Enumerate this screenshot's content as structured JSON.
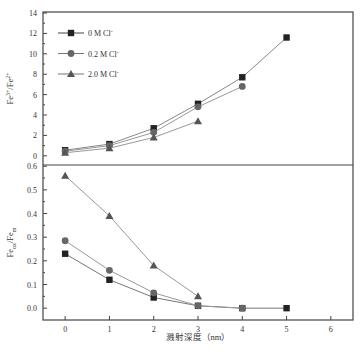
{
  "chart_data": [
    {
      "type": "line",
      "panel": "top",
      "title": "",
      "xlabel": "",
      "ylabel": "Fe3+/Fe2+",
      "ylabel_parts": {
        "base1": "Fe",
        "sup1": "3+",
        "sep": "/Fe",
        "sup2": "2+"
      },
      "xlim": [
        -0.5,
        6.5
      ],
      "ylim": [
        -0.9,
        14.1
      ],
      "yticks": [
        0,
        2,
        4,
        6,
        8,
        10,
        12,
        14
      ],
      "ytick_labels": [
        "0",
        "2",
        "4",
        "6",
        "8",
        "10",
        "12",
        "14"
      ],
      "grid": false,
      "legend": "top-left",
      "series": [
        {
          "name": "0 M Cl-",
          "label": "0 M Cl",
          "sup": "-",
          "marker": "square",
          "color": "#222222",
          "line_color": "#888888",
          "x": [
            0,
            1,
            2,
            3,
            4,
            5
          ],
          "values": [
            0.55,
            1.15,
            2.7,
            5.1,
            7.7,
            11.6
          ]
        },
        {
          "name": "0.2 M Cl-",
          "label": "0.2 M Cl",
          "sup": "-",
          "marker": "circle",
          "color": "#666666",
          "line_color": "#999999",
          "x": [
            0,
            1,
            2,
            3,
            4
          ],
          "values": [
            0.45,
            1.0,
            2.3,
            4.8,
            6.8
          ]
        },
        {
          "name": "2.0 M Cl-",
          "label": "2.0 M Cl",
          "sup": "-",
          "marker": "triangle",
          "color": "#555555",
          "line_color": "#999999",
          "x": [
            0,
            1,
            2,
            3
          ],
          "values": [
            0.3,
            0.75,
            1.8,
            3.4
          ]
        }
      ]
    },
    {
      "type": "line",
      "panel": "bottom",
      "title": "",
      "xlabel": "溅射深度（nm）",
      "ylabel": "Fe_ox/Fe_m",
      "ylabel_parts": {
        "base1": "Fe",
        "sub1": "ox",
        "sep": "/Fe",
        "sub2": "m"
      },
      "xlim": [
        -0.5,
        6.5
      ],
      "ylim": [
        -0.05,
        0.605
      ],
      "xticks": [
        0,
        1,
        2,
        3,
        4,
        5,
        6
      ],
      "xtick_labels": [
        "0",
        "1",
        "2",
        "3",
        "4",
        "5",
        "6"
      ],
      "yticks": [
        0.0,
        0.1,
        0.2,
        0.3,
        0.4,
        0.5,
        0.6
      ],
      "ytick_labels": [
        "0.0",
        "0.1",
        "0.2",
        "0.3",
        "0.4",
        "0.5",
        "0.6"
      ],
      "grid": false,
      "series": [
        {
          "name": "0 M Cl-",
          "marker": "square",
          "color": "#222222",
          "line_color": "#777777",
          "x": [
            0,
            1,
            2,
            3,
            4,
            5
          ],
          "values": [
            0.23,
            0.12,
            0.045,
            0.01,
            0.0,
            0.0
          ]
        },
        {
          "name": "0.2 M Cl-",
          "marker": "circle",
          "color": "#666666",
          "line_color": "#999999",
          "x": [
            0,
            1,
            2,
            3,
            4
          ],
          "values": [
            0.285,
            0.16,
            0.065,
            0.01,
            0.0
          ]
        },
        {
          "name": "2.0 M Cl-",
          "marker": "triangle",
          "color": "#555555",
          "line_color": "#999999",
          "x": [
            0,
            1,
            2,
            3
          ],
          "values": [
            0.56,
            0.39,
            0.18,
            0.05
          ]
        }
      ]
    }
  ]
}
